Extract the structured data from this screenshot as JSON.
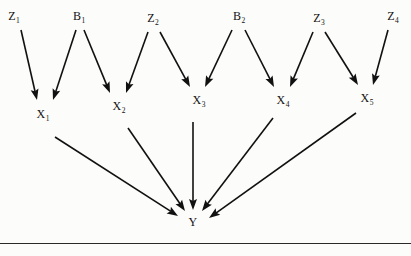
{
  "figure": {
    "kind": "causal-path-diagram",
    "background_color": "#fcfcfa",
    "ink_color": "#111111",
    "rule": {
      "y": 243,
      "color": "#2a2a2a"
    }
  },
  "nodes": [
    {
      "id": "Z1",
      "base": "Z",
      "sub": "1",
      "text": "Z1",
      "x": 14,
      "y": 16,
      "row": "top"
    },
    {
      "id": "B1",
      "base": "B",
      "sub": "1",
      "text": "B1",
      "x": 79,
      "y": 16,
      "row": "top"
    },
    {
      "id": "Z2",
      "base": "Z",
      "sub": "2",
      "text": "Z2",
      "x": 153,
      "y": 18,
      "row": "top"
    },
    {
      "id": "B2",
      "base": "B",
      "sub": "2",
      "text": "B2",
      "x": 239,
      "y": 16,
      "row": "top"
    },
    {
      "id": "Z3",
      "base": "Z",
      "sub": "3",
      "text": "Z3",
      "x": 319,
      "y": 18,
      "row": "top"
    },
    {
      "id": "Z4",
      "base": "Z",
      "sub": "4",
      "text": "Z4",
      "x": 393,
      "y": 16,
      "row": "top"
    },
    {
      "id": "X1",
      "base": "X",
      "sub": "1",
      "text": "X1",
      "x": 43,
      "y": 114,
      "row": "middle"
    },
    {
      "id": "X2",
      "base": "X",
      "sub": "2",
      "text": "X2",
      "x": 119,
      "y": 106,
      "row": "middle"
    },
    {
      "id": "X3",
      "base": "X",
      "sub": "3",
      "text": "X3",
      "x": 199,
      "y": 100,
      "row": "middle"
    },
    {
      "id": "X4",
      "base": "X",
      "sub": "4",
      "text": "X4",
      "x": 283,
      "y": 100,
      "row": "middle"
    },
    {
      "id": "X5",
      "base": "X",
      "sub": "5",
      "text": "X5",
      "x": 367,
      "y": 98,
      "row": "middle"
    },
    {
      "id": "Y",
      "base": "Y",
      "sub": "",
      "text": "Y",
      "x": 193,
      "y": 222,
      "row": "bottom"
    }
  ],
  "edges": [
    {
      "from": "Z1",
      "to": "X1",
      "x1": 21,
      "y1": 30,
      "x2": 37,
      "y2": 100
    },
    {
      "from": "B1",
      "to": "X1",
      "x1": 76,
      "y1": 30,
      "x2": 53,
      "y2": 100
    },
    {
      "from": "B1",
      "to": "X2",
      "x1": 84,
      "y1": 30,
      "x2": 110,
      "y2": 93
    },
    {
      "from": "Z2",
      "to": "X2",
      "x1": 148,
      "y1": 32,
      "x2": 126,
      "y2": 93
    },
    {
      "from": "Z2",
      "to": "X3",
      "x1": 160,
      "y1": 32,
      "x2": 190,
      "y2": 87
    },
    {
      "from": "B2",
      "to": "X3",
      "x1": 232,
      "y1": 30,
      "x2": 205,
      "y2": 87
    },
    {
      "from": "B2",
      "to": "X4",
      "x1": 245,
      "y1": 30,
      "x2": 274,
      "y2": 87
    },
    {
      "from": "Z3",
      "to": "X4",
      "x1": 313,
      "y1": 32,
      "x2": 290,
      "y2": 87
    },
    {
      "from": "Z3",
      "to": "X5",
      "x1": 325,
      "y1": 32,
      "x2": 358,
      "y2": 85
    },
    {
      "from": "Z4",
      "to": "X5",
      "x1": 388,
      "y1": 30,
      "x2": 373,
      "y2": 85
    },
    {
      "from": "X1",
      "to": "Y",
      "x1": 55,
      "y1": 137,
      "x2": 178,
      "y2": 216
    },
    {
      "from": "X2",
      "to": "Y",
      "x1": 128,
      "y1": 128,
      "x2": 185,
      "y2": 211
    },
    {
      "from": "X3",
      "to": "Y",
      "x1": 193,
      "y1": 122,
      "x2": 193,
      "y2": 210
    },
    {
      "from": "X4",
      "to": "Y",
      "x1": 273,
      "y1": 118,
      "x2": 202,
      "y2": 211
    },
    {
      "from": "X5",
      "to": "Y",
      "x1": 356,
      "y1": 113,
      "x2": 209,
      "y2": 218
    }
  ]
}
